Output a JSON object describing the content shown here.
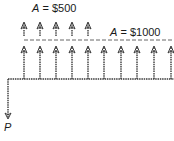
{
  "diagram": {
    "type": "cash-flow-diagram",
    "labels": {
      "upper_annuity": {
        "var": "A",
        "eq": " = ",
        "value": "$500"
      },
      "lower_annuity": {
        "var": "A",
        "eq": " = ",
        "value": "$1000"
      },
      "present_value": "P"
    },
    "periods": 10,
    "upper_arrow_count": 5,
    "lower_arrow_count": 10,
    "colors": {
      "line": "#3a3a3a",
      "text": "#1a1a1a"
    }
  }
}
